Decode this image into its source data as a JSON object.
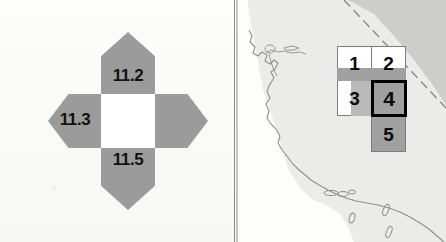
{
  "figure": {
    "type": "two-panel-figure",
    "panel_count": 2
  },
  "left_panel": {
    "name": "compass-rose-diagram",
    "description": "Four-petal compass rose with white center square and numeric labels",
    "center_value": "",
    "petals": [
      {
        "direction": "north",
        "label": "11.2",
        "fill": "#9b9b9b"
      },
      {
        "direction": "west",
        "label": "11.3",
        "fill": "#9b9b9b"
      },
      {
        "direction": "south",
        "label": "11.5",
        "fill": "#9b9b9b"
      },
      {
        "direction": "east",
        "label": "",
        "fill": "#9b9b9b"
      }
    ],
    "labels": {
      "north": "11.2",
      "west": "11.3",
      "south": "11.5",
      "east": ""
    },
    "colors": {
      "petal": "#9b9b9b",
      "center": "#ffffff",
      "text": "#111111"
    }
  },
  "right_panel": {
    "name": "map-with-grid-cells",
    "description": "Coastline map with a grid of five numbered cells overlaid",
    "grid": {
      "cells": [
        {
          "id": "1",
          "label": "1",
          "row": 1,
          "col": 1,
          "fill": "#ffffff",
          "highlighted": false
        },
        {
          "id": "2",
          "label": "2",
          "row": 1,
          "col": 2,
          "fill": "#ffffff",
          "highlighted": false
        },
        {
          "id": "3",
          "label": "3",
          "row": 2,
          "col": 1,
          "fill": "#ffffff",
          "highlighted": false
        },
        {
          "id": "4",
          "label": "4",
          "row": 2,
          "col": 2,
          "fill": "#a0a0a0",
          "highlighted": true
        },
        {
          "id": "5",
          "label": "5",
          "row": 3,
          "col": 2,
          "fill": "#a0a0a0",
          "highlighted": false
        }
      ],
      "highlighted_cell": "4",
      "colors": {
        "cell_border": "#7d7d7d",
        "highlight_border": "#000000",
        "shaded_fill": "#a0a0a0",
        "empty_fill": "#ffffff",
        "text": "#0a0a0a"
      }
    },
    "map": {
      "land_fill": "#e4e4e2",
      "coastline_color": "#8a8a8a",
      "state_border_style": "dashed",
      "state_border_color": "#9a9a9a"
    }
  },
  "colors": {
    "background": "#fbfbfa",
    "divider": "#8d8d8d"
  }
}
